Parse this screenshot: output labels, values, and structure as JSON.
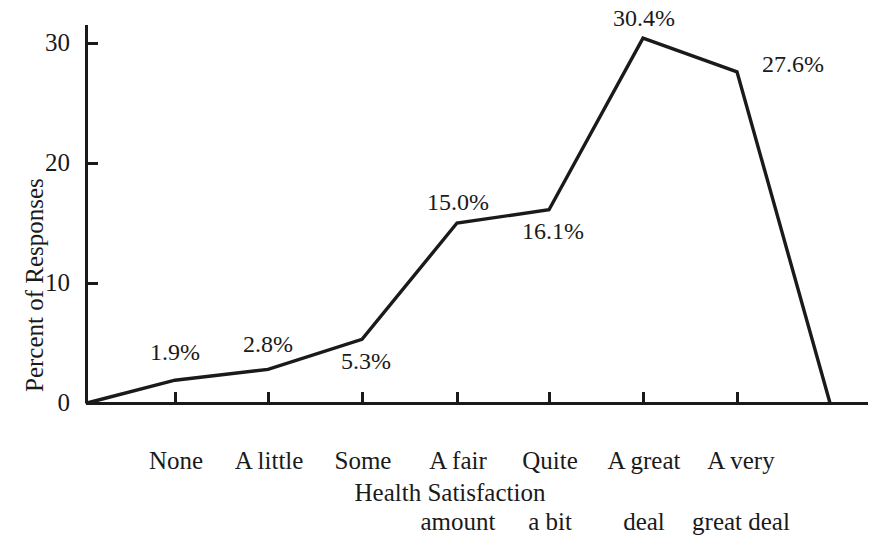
{
  "chart_data": {
    "type": "line",
    "title": "",
    "xlabel": "Health Satisfaction",
    "ylabel": "Percent of Responses",
    "categories": [
      "None",
      "A little",
      "Some",
      "A fair amount",
      "Quite a bit",
      "A great deal",
      "A very great deal"
    ],
    "values": [
      1.9,
      2.8,
      5.3,
      15.0,
      16.1,
      30.4,
      27.6
    ],
    "point_labels": [
      "1.9%",
      "2.8%",
      "5.3%",
      "15.0%",
      "16.1%",
      "30.4%",
      "27.6%"
    ],
    "yticks": [
      0,
      10,
      20,
      30
    ],
    "ytick_labels": [
      "0",
      "10",
      "20",
      "30"
    ],
    "ylim": [
      0,
      33
    ],
    "grid": false,
    "legend": false,
    "line_color": "#1a1a1a",
    "background_color": "#ffffff"
  },
  "axes": {
    "y_tick_0": "0",
    "y_tick_1": "10",
    "y_tick_2": "20",
    "y_tick_3": "30",
    "y_axis_title": "Percent of Responses",
    "x_axis_title": "Health Satisfaction"
  },
  "x_categories": [
    {
      "line1": "None",
      "line2": ""
    },
    {
      "line1": "A little",
      "line2": ""
    },
    {
      "line1": "Some",
      "line2": ""
    },
    {
      "line1": "A fair",
      "line2": "amount"
    },
    {
      "line1": "Quite",
      "line2": "a bit"
    },
    {
      "line1": "A great",
      "line2": "deal"
    },
    {
      "line1": "A very",
      "line2": "great deal"
    }
  ],
  "point_labels": {
    "p0": "1.9%",
    "p1": "2.8%",
    "p2": "5.3%",
    "p3": "15.0%",
    "p4": "16.1%",
    "p5": "30.4%",
    "p6": "27.6%"
  }
}
